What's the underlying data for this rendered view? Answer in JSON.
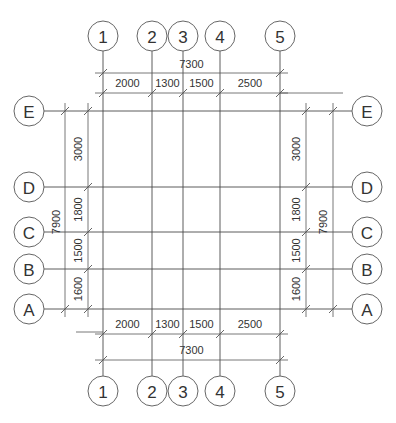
{
  "drawing": {
    "type": "structural-axis-grid-plan",
    "colors": {
      "line": "#4a4a4a",
      "text": "#333333",
      "background": "#ffffff"
    }
  },
  "axes_vertical": [
    {
      "label": "1",
      "x": 103
    },
    {
      "label": "2",
      "x": 152
    },
    {
      "label": "3",
      "x": 183
    },
    {
      "label": "4",
      "x": 220
    },
    {
      "label": "5",
      "x": 280
    }
  ],
  "axes_horizontal": [
    {
      "label": "E",
      "y": 111
    },
    {
      "label": "D",
      "y": 187
    },
    {
      "label": "C",
      "y": 232
    },
    {
      "label": "B",
      "y": 269
    },
    {
      "label": "A",
      "y": 309
    }
  ],
  "dimensions": {
    "top_total": "7300",
    "top_spans": [
      "2000",
      "1300",
      "1500",
      "2500"
    ],
    "bottom_total": "7300",
    "bottom_spans": [
      "2000",
      "1300",
      "1500",
      "2500"
    ],
    "left_total": "7900",
    "left_spans": [
      "3000",
      "1800",
      "1500",
      "1600"
    ],
    "right_total": "7900",
    "right_spans": [
      "3000",
      "1800",
      "1500",
      "1600"
    ]
  }
}
